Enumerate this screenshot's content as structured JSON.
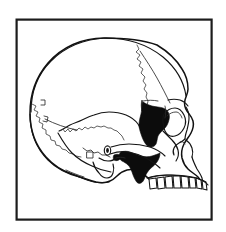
{
  "figure": {
    "title": "Lateral view of human skull",
    "caption": "",
    "orientation": "left lateral profile, facing right",
    "line_art_style": "black ink outline drawing",
    "background_color": "#ffffff",
    "line_color": "#111111",
    "shading_color": "#0c0c0c",
    "frame": {
      "label": "illustration border",
      "stroke_color": "#1c1c1c",
      "stroke_width_px": 2,
      "x": 16,
      "y": 19,
      "width": 196,
      "height": 201
    },
    "shaded_regions": [
      {
        "name": "greater wing of sphenoid at pterion",
        "color": "#0c0c0c",
        "approx_center": [
          148,
          120
        ]
      },
      {
        "name": "pterygoid and posterior maxilla region",
        "color": "#0c0c0c",
        "approx_center": [
          140,
          165
        ]
      }
    ],
    "anatomical_parts": [
      "frontal bone",
      "parietal bone",
      "occipital bone",
      "temporal bone squamous portion",
      "greater wing of sphenoid",
      "zygomatic arch",
      "zygomatic bone",
      "orbit",
      "nasal bones",
      "nasal aperture",
      "maxilla",
      "maxillary teeth",
      "mastoid process",
      "external acoustic meatus",
      "coronal suture",
      "lambdoid suture",
      "squamosal suture"
    ],
    "tooth_count_visible": 8
  }
}
